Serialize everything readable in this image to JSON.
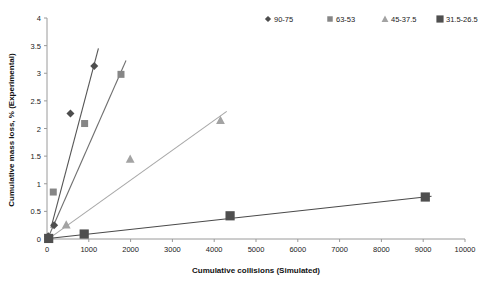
{
  "chart_data": {
    "type": "scatter",
    "title": "",
    "xlabel": "Cumulative collisions (Simulated)",
    "ylabel": "Cumulative mass loss, % (Experimental)",
    "xlim": [
      0,
      10000
    ],
    "ylim": [
      0,
      4
    ],
    "xticks": [
      0,
      1000,
      2000,
      3000,
      4000,
      5000,
      6000,
      7000,
      8000,
      9000,
      10000
    ],
    "xtick_labels": [
      "0",
      "1000",
      "2000",
      "3000",
      "4000",
      "5000",
      "6000",
      "7000",
      "8000",
      "9000",
      "10000"
    ],
    "yticks": [
      0,
      0.5,
      1,
      1.5,
      2,
      2.5,
      3,
      3.5,
      4
    ],
    "ytick_labels": [
      "0",
      "0.5",
      "1",
      "1.5",
      "2",
      "2.5",
      "3",
      "3.5",
      "4"
    ],
    "grid": false,
    "legend_position": "top-right",
    "series": [
      {
        "name": "90-75",
        "marker": "diamond",
        "color": "#4d4d4d",
        "line_color": "#555555",
        "points": [
          [
            30,
            0.05
          ],
          [
            170,
            0.25
          ],
          [
            560,
            2.27
          ],
          [
            1130,
            3.13
          ]
        ],
        "trendline": [
          [
            95,
            0.2
          ],
          [
            1230,
            3.45
          ]
        ]
      },
      {
        "name": "63-53",
        "marker": "square",
        "color": "#868686",
        "line_color": "#6f6f6f",
        "points": [
          [
            150,
            0.85
          ],
          [
            900,
            2.09
          ],
          [
            1770,
            2.98
          ]
        ],
        "trendline": [
          [
            60,
            0.08
          ],
          [
            1890,
            3.23
          ]
        ]
      },
      {
        "name": "45-37.5",
        "marker": "triangle",
        "color": "#a3a3a3",
        "line_color": "#a8a8a8",
        "points": [
          [
            460,
            0.26
          ],
          [
            1990,
            1.45
          ],
          [
            4150,
            2.15
          ]
        ],
        "trendline": [
          [
            70,
            0.02
          ],
          [
            4300,
            2.31
          ]
        ]
      },
      {
        "name": "31.5-26.5",
        "marker": "bigsquare",
        "color": "#4f4f4f",
        "line_color": "#4a4a4a",
        "points": [
          [
            40,
            0.01
          ],
          [
            890,
            0.09
          ],
          [
            4380,
            0.42
          ],
          [
            9050,
            0.76
          ]
        ],
        "trendline": [
          [
            30,
            0.01
          ],
          [
            9200,
            0.775
          ]
        ]
      }
    ],
    "legend": [
      {
        "label": "90-75",
        "marker": "diamond",
        "color": "#4d4d4d"
      },
      {
        "label": "63-53",
        "marker": "square",
        "color": "#868686"
      },
      {
        "label": "45-37.5",
        "marker": "triangle",
        "color": "#a3a3a3"
      },
      {
        "label": "31.5-26.5",
        "marker": "bigsquare",
        "color": "#4f4f4f"
      }
    ]
  }
}
